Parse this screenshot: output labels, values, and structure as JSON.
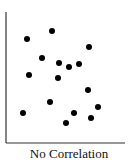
{
  "chart_data": {
    "type": "scatter",
    "title": "No Correlation",
    "xlabel": "No Correlation",
    "ylabel": "",
    "grid": false,
    "legend": null,
    "points": [
      {
        "x": 27,
        "y": 39
      },
      {
        "x": 52,
        "y": 31
      },
      {
        "x": 89,
        "y": 47
      },
      {
        "x": 42,
        "y": 58
      },
      {
        "x": 59,
        "y": 63
      },
      {
        "x": 69,
        "y": 67
      },
      {
        "x": 79,
        "y": 64
      },
      {
        "x": 29,
        "y": 75
      },
      {
        "x": 58,
        "y": 78
      },
      {
        "x": 88,
        "y": 90
      },
      {
        "x": 50,
        "y": 102
      },
      {
        "x": 23,
        "y": 113
      },
      {
        "x": 74,
        "y": 113
      },
      {
        "x": 98,
        "y": 107
      },
      {
        "x": 91,
        "y": 118
      },
      {
        "x": 66,
        "y": 123
      }
    ],
    "point_color": "#000000"
  },
  "caption": "No Correlation"
}
